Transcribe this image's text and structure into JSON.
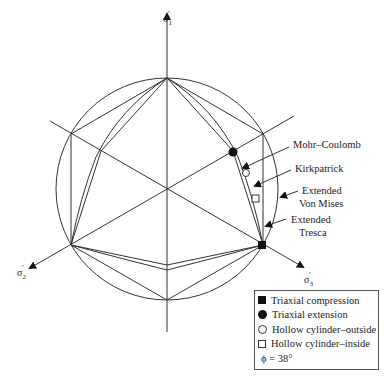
{
  "axes": {
    "sigma1": "σ′1",
    "sigma2": "σ′2",
    "sigma3": "σ′3"
  },
  "criteria_labels": {
    "mohr_coulomb": "Mohr–Coulomb",
    "kirkpatrick": "Kirkpatrick",
    "von_mises_line1": "Extended",
    "von_mises_line2": "Von Mises",
    "tresca_line1": "Extended",
    "tresca_line2": "Tresca"
  },
  "legend": {
    "items": [
      {
        "symbol": "filled-square",
        "label": "Triaxial compression"
      },
      {
        "symbol": "filled-circle",
        "label": "Triaxial extension"
      },
      {
        "symbol": "open-circle",
        "label": "Hollow cylinder–outside"
      },
      {
        "symbol": "open-square",
        "label": "Hollow cylinder–inside"
      }
    ],
    "friction_angle": "ϕ = 38°"
  },
  "colors": {
    "line": "#333333",
    "marker": "#111111",
    "background": "#ffffff"
  }
}
